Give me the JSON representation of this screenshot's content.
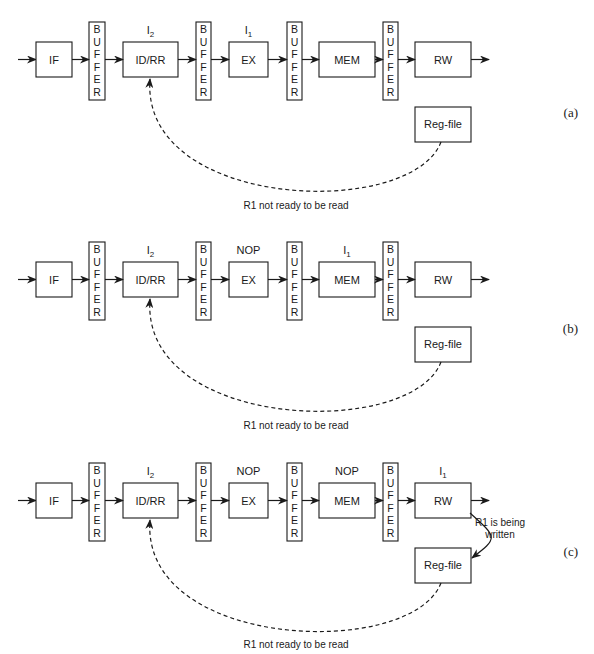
{
  "stages": [
    "IF",
    "ID/RR",
    "EX",
    "MEM",
    "RW"
  ],
  "buffer_label": "BUFFER",
  "reg_file_label": "Reg-file",
  "panels": [
    {
      "id": "a",
      "label": "(a)",
      "annotations": {
        "IDRR": "I2",
        "EX": "I1",
        "MEM": "",
        "RW": ""
      },
      "dashed_caption": "R1 not ready to be read",
      "write_caption": ""
    },
    {
      "id": "b",
      "label": "(b)",
      "annotations": {
        "IDRR": "I2",
        "EX": "NOP",
        "MEM": "I1",
        "RW": ""
      },
      "dashed_caption": "R1 not ready to be read",
      "write_caption": ""
    },
    {
      "id": "c",
      "label": "(c)",
      "annotations": {
        "IDRR": "I2",
        "EX": "NOP",
        "MEM": "NOP",
        "RW": "I1"
      },
      "dashed_caption": "R1 not ready to be read",
      "write_caption": [
        "R1 is being",
        "written"
      ]
    }
  ]
}
